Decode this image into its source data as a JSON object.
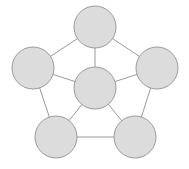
{
  "diagram": {
    "type": "node-link-graph",
    "background_color": "#ffffff",
    "canvas": {
      "width": 189,
      "height": 169
    },
    "style": {
      "node_fill": "#dcdcdc",
      "node_stroke": "#9b9b9b",
      "node_stroke_width": 1,
      "edge_stroke": "#9a9a9a",
      "edge_stroke_width": 1,
      "node_radius": 21
    },
    "nodes": [
      {
        "id": "top",
        "name": "node-top",
        "cx": 95,
        "cy": 27,
        "r": 21,
        "label": ""
      },
      {
        "id": "left",
        "name": "node-left",
        "cx": 33,
        "cy": 68,
        "r": 21,
        "label": ""
      },
      {
        "id": "right",
        "name": "node-right",
        "cx": 157,
        "cy": 68,
        "r": 21,
        "label": ""
      },
      {
        "id": "center",
        "name": "node-center",
        "cx": 95,
        "cy": 88,
        "r": 21,
        "label": ""
      },
      {
        "id": "bottom-left",
        "name": "node-bottom-left",
        "cx": 56,
        "cy": 137,
        "r": 21,
        "label": ""
      },
      {
        "id": "bottom-right",
        "name": "node-bottom-right",
        "cx": 135,
        "cy": 137,
        "r": 21,
        "label": ""
      }
    ],
    "edges": [
      {
        "id": "e-top-left",
        "from": "top",
        "to": "left",
        "kind": "rim"
      },
      {
        "id": "e-top-right",
        "from": "top",
        "to": "right",
        "kind": "rim"
      },
      {
        "id": "e-left-bottomleft",
        "from": "left",
        "to": "bottom-left",
        "kind": "rim"
      },
      {
        "id": "e-right-bottomright",
        "from": "right",
        "to": "bottom-right",
        "kind": "rim"
      },
      {
        "id": "e-bottomleft-bottomright",
        "from": "bottom-left",
        "to": "bottom-right",
        "kind": "rim"
      },
      {
        "id": "e-center-top",
        "from": "center",
        "to": "top",
        "kind": "spoke"
      },
      {
        "id": "e-center-left",
        "from": "center",
        "to": "left",
        "kind": "spoke"
      },
      {
        "id": "e-center-right",
        "from": "center",
        "to": "right",
        "kind": "spoke"
      },
      {
        "id": "e-center-bottomleft",
        "from": "center",
        "to": "bottom-left",
        "kind": "spoke"
      },
      {
        "id": "e-center-bottomright",
        "from": "center",
        "to": "bottom-right",
        "kind": "spoke"
      }
    ]
  }
}
